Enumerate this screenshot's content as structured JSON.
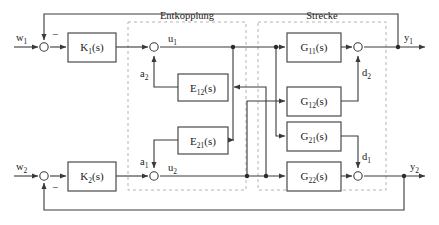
{
  "figure": {
    "groups": [
      {
        "id": "entkopplung",
        "label": "Entkopplung"
      },
      {
        "id": "strecke",
        "label": "Strecke"
      }
    ]
  },
  "blocks": {
    "k1": {
      "label": "K₁(s)",
      "base": "K",
      "sub": "1",
      "suffix": "(s)"
    },
    "k2": {
      "label": "K₂(s)",
      "base": "K",
      "sub": "2",
      "suffix": "(s)"
    },
    "e12": {
      "label": "E₁₂(s)",
      "base": "E",
      "sub": "12",
      "suffix": "(s)"
    },
    "e21": {
      "label": "E₂₁(s)",
      "base": "E",
      "sub": "21",
      "suffix": "(s)"
    },
    "g11": {
      "label": "G₁₁(s)",
      "base": "G",
      "sub": "11",
      "suffix": "(s)"
    },
    "g12": {
      "label": "G₁₂(s)",
      "base": "G",
      "sub": "12",
      "suffix": "(s)"
    },
    "g21": {
      "label": "G₂₁(s)",
      "base": "G",
      "sub": "21",
      "suffix": "(s)"
    },
    "g22": {
      "label": "G₂₂(s)",
      "base": "G",
      "sub": "22",
      "suffix": "(s)"
    }
  },
  "signals": {
    "w1": {
      "base": "w",
      "sub": "1"
    },
    "w2": {
      "base": "w",
      "sub": "2"
    },
    "u1": {
      "base": "u",
      "sub": "1"
    },
    "u2": {
      "base": "u",
      "sub": "2"
    },
    "a1": {
      "base": "a",
      "sub": "1"
    },
    "a2": {
      "base": "a",
      "sub": "2"
    },
    "d1": {
      "base": "d",
      "sub": "1"
    },
    "d2": {
      "base": "d",
      "sub": "2"
    },
    "y1": {
      "base": "y",
      "sub": "1"
    },
    "y2": {
      "base": "y",
      "sub": "2"
    }
  },
  "summers": {
    "sum_w1": {
      "sign": "−"
    },
    "sum_w2": {
      "sign": "−"
    },
    "sum_u1": {
      "sign": ""
    },
    "sum_u2": {
      "sign": ""
    },
    "sum_y1": {
      "sign": ""
    },
    "sum_y2": {
      "sign": ""
    }
  },
  "colors": {
    "wire": "#3a3a3a",
    "box_stroke": "#4a4a4a",
    "group_stroke": "#b4b4b4",
    "background": "#ffffff",
    "text": "#1a1a1a"
  }
}
